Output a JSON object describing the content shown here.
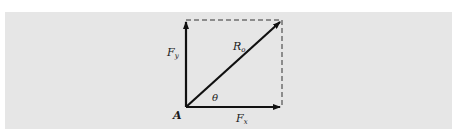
{
  "diagram": {
    "type": "vector-resolution",
    "background_color": "#e6e6e6",
    "line_color": "#111111",
    "labels": {
      "origin": "A",
      "angle": "θ",
      "vertical_component": {
        "main": "F",
        "sub": "y"
      },
      "horizontal_component": {
        "main": "F",
        "sub": "x"
      },
      "resultant": {
        "main": "R",
        "sub": "o"
      }
    },
    "vectors": [
      {
        "name": "Fy",
        "from": [
          186,
          107
        ],
        "to": [
          186,
          20
        ],
        "style": "solid-arrow"
      },
      {
        "name": "Fx",
        "from": [
          186,
          107
        ],
        "to": [
          282,
          107
        ],
        "style": "solid-arrow"
      },
      {
        "name": "Ro",
        "from": [
          186,
          107
        ],
        "to": [
          282,
          20
        ],
        "style": "solid-arrow"
      }
    ],
    "construction_lines": [
      {
        "from": [
          186,
          20
        ],
        "to": [
          282,
          20
        ],
        "style": "dashed"
      },
      {
        "from": [
          282,
          20
        ],
        "to": [
          282,
          107
        ],
        "style": "dashed"
      }
    ]
  }
}
